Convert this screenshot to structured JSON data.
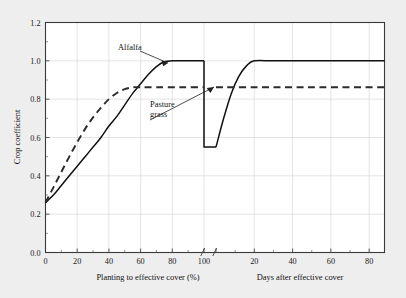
{
  "chart_data": {
    "type": "line",
    "title": "",
    "subtitle": "",
    "ylabel": "Crop coefficient",
    "ylim": [
      0.0,
      1.2
    ],
    "ytick_labels": [
      "0.0",
      "0.2",
      "0.4",
      "0.6",
      "0.8",
      "1.0",
      "1.2"
    ],
    "ytick_values": [
      0.0,
      0.2,
      0.4,
      0.6,
      0.8,
      1.0,
      1.2
    ],
    "y_minor_step": 0.1,
    "grid": true,
    "legend": "none",
    "broken_axis": true,
    "panels": [
      {
        "name": "left",
        "xlabel": "Planting to effective cover (%)",
        "xlim": [
          0,
          100
        ],
        "xtick_labels": [
          "0",
          "20",
          "40",
          "60",
          "80",
          "100"
        ],
        "xtick_values": [
          0,
          20,
          40,
          60,
          80,
          100
        ],
        "x_minor_step": 10
      },
      {
        "name": "right",
        "xlabel": "Days after effective cover",
        "xlim": [
          0,
          88
        ],
        "xtick_labels": [
          "20",
          "40",
          "60",
          "80"
        ],
        "xtick_values": [
          20,
          40,
          60,
          80
        ],
        "x_minor_step": 10
      }
    ],
    "series": [
      {
        "name": "Alfalfa",
        "style": "solid",
        "color": "#111111",
        "left_panel": [
          {
            "x": 0,
            "y": 0.26
          },
          {
            "x": 5,
            "y": 0.3
          },
          {
            "x": 10,
            "y": 0.35
          },
          {
            "x": 15,
            "y": 0.4
          },
          {
            "x": 20,
            "y": 0.45
          },
          {
            "x": 25,
            "y": 0.5
          },
          {
            "x": 30,
            "y": 0.55
          },
          {
            "x": 35,
            "y": 0.6
          },
          {
            "x": 40,
            "y": 0.66
          },
          {
            "x": 45,
            "y": 0.71
          },
          {
            "x": 50,
            "y": 0.77
          },
          {
            "x": 55,
            "y": 0.83
          },
          {
            "x": 60,
            "y": 0.88
          },
          {
            "x": 65,
            "y": 0.93
          },
          {
            "x": 70,
            "y": 0.97
          },
          {
            "x": 75,
            "y": 0.995
          },
          {
            "x": 80,
            "y": 1.0
          },
          {
            "x": 90,
            "y": 1.0
          },
          {
            "x": 100,
            "y": 1.0
          }
        ],
        "drop": {
          "x": 100,
          "y_from": 1.0,
          "y_to": 0.55
        },
        "right_panel": [
          {
            "x": 0,
            "y": 0.55
          },
          {
            "x": 4,
            "y": 0.7
          },
          {
            "x": 8,
            "y": 0.83
          },
          {
            "x": 12,
            "y": 0.92
          },
          {
            "x": 16,
            "y": 0.975
          },
          {
            "x": 20,
            "y": 1.0
          },
          {
            "x": 30,
            "y": 1.0
          },
          {
            "x": 45,
            "y": 1.0
          },
          {
            "x": 60,
            "y": 1.0
          },
          {
            "x": 75,
            "y": 1.0
          },
          {
            "x": 88,
            "y": 1.0
          }
        ]
      },
      {
        "name": "Pasture grass",
        "style": "dashed",
        "color": "#2b2b2b",
        "left_panel": [
          {
            "x": 0,
            "y": 0.26
          },
          {
            "x": 5,
            "y": 0.34
          },
          {
            "x": 10,
            "y": 0.42
          },
          {
            "x": 15,
            "y": 0.5
          },
          {
            "x": 20,
            "y": 0.575
          },
          {
            "x": 25,
            "y": 0.645
          },
          {
            "x": 30,
            "y": 0.705
          },
          {
            "x": 35,
            "y": 0.755
          },
          {
            "x": 40,
            "y": 0.8
          },
          {
            "x": 45,
            "y": 0.832
          },
          {
            "x": 50,
            "y": 0.852
          },
          {
            "x": 55,
            "y": 0.862
          },
          {
            "x": 60,
            "y": 0.862
          },
          {
            "x": 70,
            "y": 0.862
          },
          {
            "x": 85,
            "y": 0.862
          },
          {
            "x": 100,
            "y": 0.862
          }
        ],
        "right_panel": [
          {
            "x": 0,
            "y": 0.862
          },
          {
            "x": 20,
            "y": 0.862
          },
          {
            "x": 40,
            "y": 0.862
          },
          {
            "x": 60,
            "y": 0.862
          },
          {
            "x": 88,
            "y": 0.862
          }
        ]
      }
    ],
    "annotations": [
      {
        "text": "Alfalfa",
        "label_x": 118,
        "label_y": 47,
        "points_to": "alfalfa-curve"
      },
      {
        "text": "Pasture",
        "label_x": 152,
        "label_y": 104,
        "points_to": "pasture-grass-curve"
      },
      {
        "text": "grass",
        "label_x": 152,
        "label_y": 114,
        "points_to": "pasture-grass-curve"
      }
    ]
  }
}
